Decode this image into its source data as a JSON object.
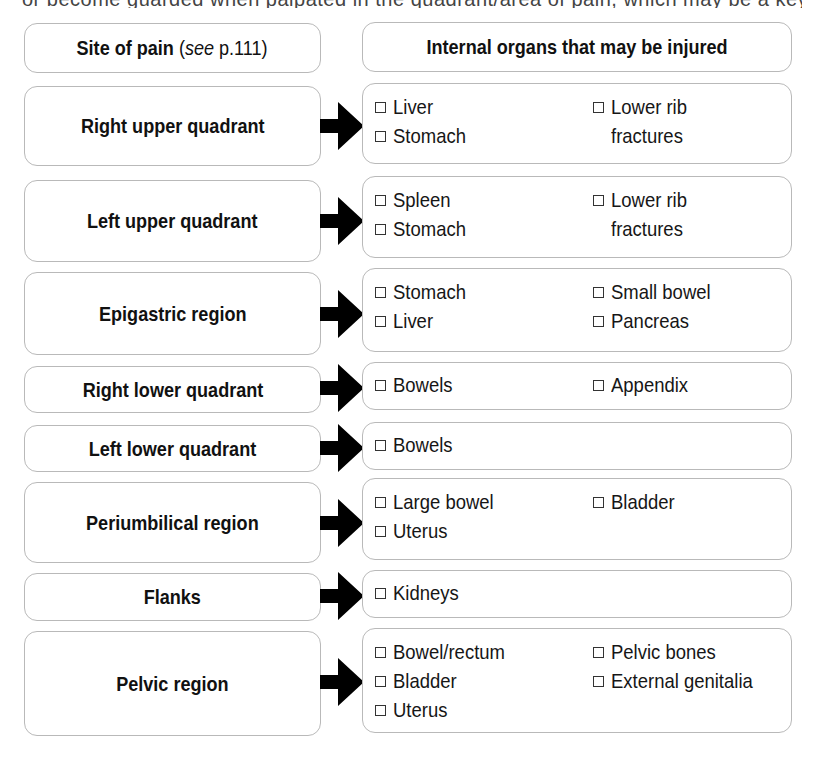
{
  "cutoff_text": "or become guarded when palpated in the quadrant/area of pain, which may be a key",
  "header": {
    "left_bold": "Site of pain",
    "left_paren_open": " (",
    "left_italic": "see",
    "left_ref": " p.111)",
    "right": "Internal organs that may be injured"
  },
  "rows": [
    {
      "site": "Right upper quadrant",
      "col1": [
        "Liver",
        "Stomach"
      ],
      "col2": [
        {
          "text": "Lower rib",
          "cont": "fractures"
        }
      ]
    },
    {
      "site": "Left upper quadrant",
      "col1": [
        "Spleen",
        "Stomach"
      ],
      "col2": [
        {
          "text": "Lower rib",
          "cont": "fractures"
        }
      ]
    },
    {
      "site": "Epigastric region",
      "col1": [
        "Stomach",
        "Liver"
      ],
      "col2": [
        {
          "text": "Small bowel"
        },
        {
          "text": "Pancreas"
        }
      ]
    },
    {
      "site": "Right lower quadrant",
      "col1": [
        "Bowels"
      ],
      "col2": [
        {
          "text": "Appendix"
        }
      ]
    },
    {
      "site": "Left lower quadrant",
      "col1": [
        "Bowels"
      ],
      "col2": []
    },
    {
      "site": "Periumbilical region",
      "col1": [
        "Large bowel",
        "Uterus"
      ],
      "col2": [
        {
          "text": "Bladder"
        }
      ]
    },
    {
      "site": "Flanks",
      "col1": [
        "Kidneys"
      ],
      "col2": []
    },
    {
      "site": "Pelvic region",
      "col1": [
        "Bowel/rectum",
        "Bladder",
        "Uterus"
      ],
      "col2": [
        {
          "text": "Pelvic bones"
        },
        {
          "text": "External genitalia"
        }
      ]
    }
  ],
  "icons": {
    "arrow": "right-arrow-icon",
    "checkbox": "empty-checkbox-icon"
  }
}
